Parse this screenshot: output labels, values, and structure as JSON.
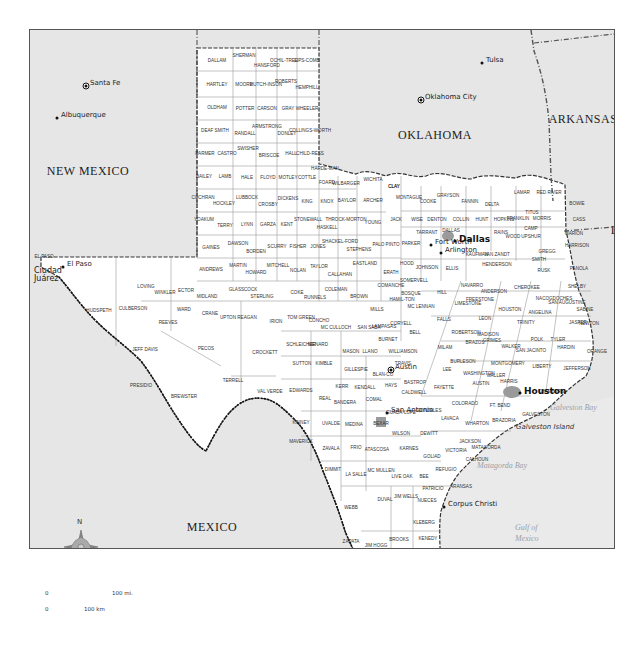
{
  "map": {
    "regions": [
      {
        "name": "new-mexico",
        "label": "NEW MEXICO",
        "x": 87,
        "y": 170
      },
      {
        "name": "oklahoma",
        "label": "OKLAHOMA",
        "x": 434,
        "y": 134
      },
      {
        "name": "arkansas",
        "label": "ARKANSAS",
        "x": 582,
        "y": 118
      },
      {
        "name": "louisiana",
        "label": "LA.",
        "x": 620,
        "y": 229
      },
      {
        "name": "mexico",
        "label": "MEXICO",
        "x": 211,
        "y": 526
      }
    ],
    "cities": [
      {
        "label": "Santa Fe",
        "x": 85,
        "y": 85,
        "type": "capital"
      },
      {
        "label": "Albuquerque",
        "x": 56,
        "y": 117,
        "type": "city"
      },
      {
        "label": "Tulsa",
        "x": 481,
        "y": 62,
        "type": "city"
      },
      {
        "label": "Oklahoma City",
        "x": 420,
        "y": 99,
        "type": "capital"
      },
      {
        "label": "El Paso",
        "x": 62,
        "y": 266,
        "type": "city"
      },
      {
        "label": "Ciudad Juárez",
        "x": 33,
        "y": 272,
        "type": "label"
      },
      {
        "label": "Fort Worth",
        "x": 430,
        "y": 244,
        "type": "city"
      },
      {
        "label": "Arlington",
        "x": 440,
        "y": 252,
        "type": "city"
      },
      {
        "label": "Dallas",
        "x": 454,
        "y": 240,
        "type": "major"
      },
      {
        "label": "Austin",
        "x": 390,
        "y": 369,
        "type": "capital"
      },
      {
        "label": "San Antonio",
        "x": 386,
        "y": 412,
        "type": "city"
      },
      {
        "label": "Houston",
        "x": 519,
        "y": 392,
        "type": "major"
      },
      {
        "label": "Corpus Christi",
        "x": 443,
        "y": 506,
        "type": "city"
      },
      {
        "label": "Reynosa",
        "x": 395,
        "y": 611,
        "type": "city"
      },
      {
        "label": "Matamoros",
        "x": 434,
        "y": 622,
        "type": "city"
      },
      {
        "label": "Monterrey",
        "x": 315,
        "y": 608,
        "type": "major"
      }
    ],
    "water": [
      {
        "label": "Galveston Bay",
        "x": 567,
        "y": 407
      },
      {
        "label": "Matagorda Bay",
        "x": 494,
        "y": 465
      },
      {
        "label": "Gulf of",
        "x": 532,
        "y": 527
      },
      {
        "label": "Mexico",
        "x": 532,
        "y": 538
      }
    ],
    "islands": [
      {
        "label": "Galveston Island",
        "x": 535,
        "y": 427
      },
      {
        "label": "Padre Island",
        "x": 448,
        "y": 567
      }
    ],
    "counties": [
      [
        "DALLAM",
        216,
        60
      ],
      [
        "SHERMAN",
        243,
        55
      ],
      [
        "HANSFORD",
        266,
        65
      ],
      [
        "OCHIL-TREE",
        283,
        60
      ],
      [
        "LIPS-COMB",
        306,
        60
      ],
      [
        "HARTLEY",
        216,
        84
      ],
      [
        "MOORE",
        243,
        84
      ],
      [
        "HUTCH-INSON",
        265,
        84
      ],
      [
        "ROBERTS",
        285,
        81
      ],
      [
        "HEMPHILL",
        306,
        87
      ],
      [
        "OLDHAM",
        216,
        107
      ],
      [
        "POTTER",
        244,
        108
      ],
      [
        "CARSON",
        266,
        108
      ],
      [
        "GRAY",
        287,
        108
      ],
      [
        "WHEELER",
        306,
        108
      ],
      [
        "DEAF SMITH",
        214,
        130
      ],
      [
        "RANDALL",
        244,
        133
      ],
      [
        "ARMSTRONG",
        266,
        126
      ],
      [
        "DONLEY",
        286,
        133
      ],
      [
        "COLLINGS-WORTH",
        309,
        130
      ],
      [
        "PARMER",
        204,
        153
      ],
      [
        "CASTRO",
        226,
        153
      ],
      [
        "SWISHER",
        247,
        148
      ],
      [
        "BRISCOE",
        268,
        155
      ],
      [
        "HALL",
        290,
        153
      ],
      [
        "CHILD-RESS",
        309,
        153
      ],
      [
        "BAILEY",
        203,
        176
      ],
      [
        "LAMB",
        224,
        176
      ],
      [
        "HALE",
        246,
        177
      ],
      [
        "FLOYD",
        267,
        177
      ],
      [
        "MOTLEY",
        287,
        177
      ],
      [
        "COTTLE",
        306,
        177
      ],
      [
        "HARDE-MAN",
        324,
        168
      ],
      [
        "FOARD",
        326,
        182
      ],
      [
        "WILBARGER",
        345,
        183
      ],
      [
        "WICHITA",
        372,
        179
      ],
      [
        "CLAY",
        393,
        186
      ],
      [
        "COCHRAN",
        202,
        197
      ],
      [
        "HOCKLEY",
        223,
        203
      ],
      [
        "LUBBOCK",
        246,
        197
      ],
      [
        "CROSBY",
        267,
        204
      ],
      [
        "DICKENS",
        287,
        198
      ],
      [
        "KING",
        306,
        201
      ],
      [
        "KNOX",
        326,
        201
      ],
      [
        "BAYLOR",
        346,
        200
      ],
      [
        "ARCHER",
        372,
        200
      ],
      [
        "YOAKUM",
        203,
        219
      ],
      [
        "TERRY",
        224,
        225
      ],
      [
        "LYNN",
        246,
        224
      ],
      [
        "GARZA",
        267,
        224
      ],
      [
        "KENT",
        286,
        224
      ],
      [
        "STONEWALL",
        307,
        219
      ],
      [
        "HASKELL",
        326,
        227
      ],
      [
        "THROCK-MORTON",
        345,
        219
      ],
      [
        "YOUNG",
        372,
        222
      ],
      [
        "JACK",
        395,
        219
      ],
      [
        "GAINES",
        210,
        247
      ],
      [
        "DAWSON",
        237,
        243
      ],
      [
        "BORDEN",
        255,
        251
      ],
      [
        "SCURRY",
        276,
        246
      ],
      [
        "FISHER",
        297,
        246
      ],
      [
        "JONES",
        317,
        246
      ],
      [
        "SHACKEL-FORD",
        339,
        241
      ],
      [
        "STEPHENS",
        358,
        249
      ],
      [
        "PALO PINTO",
        385,
        244
      ],
      [
        "ANDREWS",
        210,
        269
      ],
      [
        "MARTIN",
        237,
        265
      ],
      [
        "HOWARD",
        255,
        272
      ],
      [
        "MITCHELL",
        277,
        265
      ],
      [
        "NOLAN",
        297,
        270
      ],
      [
        "TAYLOR",
        318,
        266
      ],
      [
        "CALLAHAN",
        339,
        274
      ],
      [
        "EASTLAND",
        364,
        263
      ],
      [
        "ERATH",
        390,
        272
      ],
      [
        "LOVING",
        145,
        286
      ],
      [
        "WINKLER",
        164,
        292
      ],
      [
        "ECTOR",
        185,
        290
      ],
      [
        "MIDLAND",
        206,
        296
      ],
      [
        "GLASSCOCK",
        242,
        289
      ],
      [
        "STERLING",
        261,
        296
      ],
      [
        "COKE",
        296,
        292
      ],
      [
        "RUNNELS",
        314,
        297
      ],
      [
        "COLEMAN",
        335,
        289
      ],
      [
        "BROWN",
        358,
        296
      ],
      [
        "COMANCHE",
        390,
        285
      ],
      [
        "HAMIL-TON",
        401,
        299
      ],
      [
        "WARD",
        183,
        309
      ],
      [
        "CRANE",
        209,
        313
      ],
      [
        "UPTON",
        227,
        317
      ],
      [
        "REAGAN",
        246,
        317
      ],
      [
        "IRION",
        275,
        321
      ],
      [
        "TOM GREEN",
        300,
        317
      ],
      [
        "CONCHO",
        318,
        320
      ],
      [
        "MC CULLOCH",
        335,
        327
      ],
      [
        "SAN SABA",
        368,
        327
      ],
      [
        "MILLS",
        376,
        309
      ],
      [
        "LAMPASAS",
        383,
        326
      ],
      [
        "CULBERSON",
        132,
        308
      ],
      [
        "HUDSPETH",
        98,
        310
      ],
      [
        "REEVES",
        167,
        322
      ],
      [
        "JEFF DAVIS",
        144,
        349
      ],
      [
        "PECOS",
        205,
        348
      ],
      [
        "PRESIDIO",
        140,
        385
      ],
      [
        "BREWSTER",
        183,
        396
      ],
      [
        "TERRELL",
        232,
        380
      ],
      [
        "CROCKETT",
        264,
        352
      ],
      [
        "SCHLEICHER",
        300,
        344
      ],
      [
        "MENARD",
        317,
        344
      ],
      [
        "SUTTON",
        301,
        363
      ],
      [
        "KIMBLE",
        323,
        363
      ],
      [
        "MASON",
        350,
        351
      ],
      [
        "LLANO",
        369,
        351
      ],
      [
        "GILLESPIE",
        355,
        369
      ],
      [
        "BURNET",
        387,
        339
      ],
      [
        "BLAN-CO",
        382,
        374
      ],
      [
        "VAL VERDE",
        269,
        391
      ],
      [
        "EDWARDS",
        300,
        390
      ],
      [
        "REAL",
        324,
        398
      ],
      [
        "KERR",
        341,
        386
      ],
      [
        "BANDERA",
        344,
        402
      ],
      [
        "KENDALL",
        364,
        387
      ],
      [
        "COMAL",
        373,
        399
      ],
      [
        "HAYS",
        390,
        385
      ],
      [
        "KINNEY",
        300,
        422
      ],
      [
        "UVALDE",
        330,
        423
      ],
      [
        "MEDINA",
        353,
        424
      ],
      [
        "BEXAR",
        380,
        423
      ],
      [
        "GUADA-LUPE",
        400,
        412
      ],
      [
        "WILSON",
        400,
        433
      ],
      [
        "MAVERICK",
        300,
        441
      ],
      [
        "ZAVALA",
        330,
        448
      ],
      [
        "FRIO",
        355,
        447
      ],
      [
        "ATASCOSA",
        376,
        449
      ],
      [
        "KARNES",
        408,
        448
      ],
      [
        "DIMMIT",
        332,
        469
      ],
      [
        "LA SALLE",
        355,
        474
      ],
      [
        "MC MULLEN",
        380,
        470
      ],
      [
        "LIVE OAK",
        401,
        476
      ],
      [
        "BEE",
        423,
        476
      ],
      [
        "GOLIAD",
        431,
        456
      ],
      [
        "REFUGIO",
        445,
        469
      ],
      [
        "WEBB",
        350,
        507
      ],
      [
        "DUVAL",
        384,
        499
      ],
      [
        "JIM WELLS",
        405,
        496
      ],
      [
        "NUECES",
        426,
        500
      ],
      [
        "PATRICIO",
        432,
        488
      ],
      [
        "ARANSAS",
        460,
        486
      ],
      [
        "KLEBERG",
        423,
        522
      ],
      [
        "KENEDY",
        427,
        538
      ],
      [
        "ZAPATA",
        350,
        541
      ],
      [
        "JIM HOGG",
        375,
        545
      ],
      [
        "BROOKS",
        398,
        539
      ],
      [
        "STARR",
        379,
        567
      ],
      [
        "WILLACY",
        429,
        568
      ],
      [
        "HIDALGO",
        403,
        578
      ],
      [
        "CAMERON",
        433,
        587
      ],
      [
        "CLAY",
        393,
        186
      ],
      [
        "MONTAGUE",
        408,
        197
      ],
      [
        "COOKE",
        427,
        201
      ],
      [
        "GRAYSON",
        447,
        195
      ],
      [
        "FANNIN",
        469,
        201
      ],
      [
        "LAMAR",
        521,
        192
      ],
      [
        "RED RIVER",
        548,
        192
      ],
      [
        "BOWIE",
        576,
        203
      ],
      [
        "DELTA",
        491,
        204
      ],
      [
        "WISE",
        416,
        219
      ],
      [
        "DENTON",
        436,
        219
      ],
      [
        "COLLIN",
        460,
        219
      ],
      [
        "HUNT",
        481,
        219
      ],
      [
        "HOPKINS",
        503,
        219
      ],
      [
        "FRANKLIN",
        517,
        218
      ],
      [
        "TITUS",
        531,
        212
      ],
      [
        "MORRIS",
        541,
        218
      ],
      [
        "CAMP",
        530,
        228
      ],
      [
        "CASS",
        578,
        219
      ],
      [
        "PARKER",
        410,
        243
      ],
      [
        "TARRANT",
        426,
        232
      ],
      [
        "DALLAS",
        450,
        230
      ],
      [
        "RAINS",
        500,
        232
      ],
      [
        "WOOD",
        512,
        236
      ],
      [
        "UPSHUR",
        530,
        236
      ],
      [
        "MARION",
        573,
        233
      ],
      [
        "KAUFMAN",
        476,
        254
      ],
      [
        "VAN ZANDT",
        496,
        254
      ],
      [
        "GREGG",
        546,
        251
      ],
      [
        "HARRISON",
        576,
        245
      ],
      [
        "HOOD",
        406,
        263
      ],
      [
        "JOHNSON",
        426,
        267
      ],
      [
        "ELLIS",
        451,
        268
      ],
      [
        "HENDERSON",
        496,
        264
      ],
      [
        "SMITH",
        538,
        259
      ],
      [
        "RUSK",
        543,
        270
      ],
      [
        "PANOLA",
        578,
        268
      ],
      [
        "SOMERVELL",
        413,
        280
      ],
      [
        "BOSQUE",
        410,
        293
      ],
      [
        "HILL",
        441,
        292
      ],
      [
        "NAVARRO",
        471,
        285
      ],
      [
        "ANDERSON",
        493,
        291
      ],
      [
        "CHEROKEE",
        526,
        287
      ],
      [
        "NACOGDOCHES",
        553,
        298
      ],
      [
        "SHELBY",
        576,
        286
      ],
      [
        "MC LENNAN",
        420,
        306
      ],
      [
        "LIMESTONE",
        467,
        303
      ],
      [
        "FREESTONE",
        479,
        299
      ],
      [
        "HOUSTON",
        509,
        309
      ],
      [
        "ANGELINA",
        539,
        312
      ],
      [
        "SAN AUGUSTINE",
        566,
        302
      ],
      [
        "SABINE",
        584,
        309
      ],
      [
        "CORYELL",
        400,
        323
      ],
      [
        "FALLS",
        443,
        319
      ],
      [
        "LEON",
        484,
        318
      ],
      [
        "TRINITY",
        525,
        322
      ],
      [
        "NEWTON",
        588,
        323
      ],
      [
        "JASPER",
        577,
        322
      ],
      [
        "BELL",
        414,
        332
      ],
      [
        "ROBERTSON",
        465,
        332
      ],
      [
        "MADISON",
        487,
        334
      ],
      [
        "POLK",
        536,
        339
      ],
      [
        "TYLER",
        557,
        339
      ],
      [
        "WALKER",
        510,
        346
      ],
      [
        "SAN JACINTO",
        530,
        350
      ],
      [
        "HARDIN",
        565,
        347
      ],
      [
        "MILAM",
        444,
        347
      ],
      [
        "BRAZOS",
        474,
        342
      ],
      [
        "GRIMES",
        491,
        340
      ],
      [
        "MONTGOMERY",
        507,
        363
      ],
      [
        "LIBERTY",
        541,
        366
      ],
      [
        "ORANGE",
        596,
        351
      ],
      [
        "JEFFERSON",
        576,
        368
      ],
      [
        "WILLIAMSON",
        402,
        351
      ],
      [
        "TRAVIS",
        402,
        363
      ],
      [
        "BURLESON",
        462,
        361
      ],
      [
        "WASHINGTON",
        478,
        373
      ],
      [
        "WALLER",
        495,
        375
      ],
      [
        "HARRIS",
        508,
        381
      ],
      [
        "LEE",
        446,
        369
      ],
      [
        "BASTROP",
        414,
        382
      ],
      [
        "FAYETTE",
        443,
        387
      ],
      [
        "AUSTIN",
        480,
        383
      ],
      [
        "CHAMBERS",
        550,
        391
      ],
      [
        "CALDWELL",
        413,
        392
      ],
      [
        "GONZALES",
        428,
        410
      ],
      [
        "COLORADO",
        464,
        403
      ],
      [
        "FT. BEND",
        499,
        405
      ],
      [
        "GALVESTON",
        535,
        414
      ],
      [
        "LAVACA",
        449,
        418
      ],
      [
        "DEWITT",
        428,
        433
      ],
      [
        "WHARTON",
        476,
        423
      ],
      [
        "BRAZORIA",
        503,
        420
      ],
      [
        "JACKSON",
        469,
        441
      ],
      [
        "MATAGORDA",
        485,
        447
      ],
      [
        "VICTORIA",
        455,
        450
      ],
      [
        "CALHOUN",
        476,
        459
      ],
      [
        "EL PASO",
        43,
        256
      ]
    ],
    "scale_bar": {
      "zero_top": "0",
      "miles": "100 mi.",
      "zero_bottom": "0",
      "km": "100 km"
    },
    "compass": {
      "label": "N"
    },
    "colors": {
      "land_tx": "#ffffff",
      "land_other": "#e6e6e6",
      "county_line": "#8a8a8a",
      "border": "#333333",
      "urban": "#9a9a9a",
      "water_text": "#9aa0a8"
    }
  }
}
